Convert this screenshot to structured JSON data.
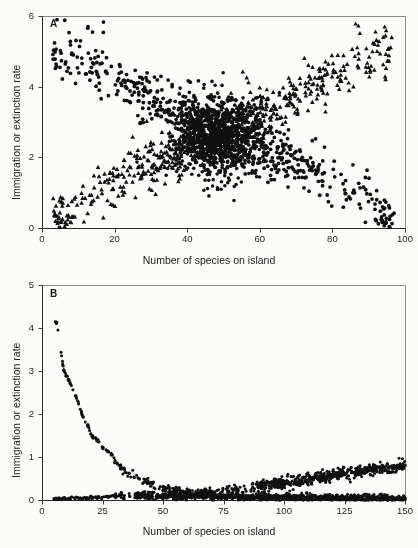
{
  "figure": {
    "background_color": "#fcfcfa",
    "ink_color": "#111111",
    "axis_color": "#8a8a8a"
  },
  "chart_data": [
    {
      "id": "panel-a",
      "type": "scatter",
      "panel_label": "A",
      "title": "",
      "xlabel": "Number of species on island",
      "ylabel": "Immigration or extinction rate",
      "xlim": [
        0,
        100
      ],
      "ylim": [
        0,
        6
      ],
      "xticks": [
        0,
        20,
        40,
        60,
        80,
        100
      ],
      "yticks": [
        0,
        2,
        4,
        6
      ],
      "xticklabels": [
        "0",
        "20",
        "40",
        "60",
        "80",
        "100"
      ],
      "yticklabels": [
        "0",
        "2",
        "4",
        "6"
      ],
      "grid": false,
      "legend": "none",
      "frame": "box",
      "plot_box_px": {
        "left": 42,
        "top": 16,
        "right": 405,
        "bottom": 228
      },
      "series": [
        {
          "name": "immigration rate",
          "marker": "circle",
          "color": "#111111",
          "marker_size": 1.9,
          "n_points": 560,
          "description": "declining cloud from high rate at few species to near zero at ~95 species",
          "trend": {
            "model": "exponential-decay-with-noise",
            "y_at_x5": 4.6,
            "y_at_x25": 3.7,
            "y_at_x45": 2.7,
            "y_at_x65": 1.9,
            "y_at_x85": 0.8,
            "y_at_x95": 0.15,
            "noise_sd": 0.42
          },
          "seed": 20414
        },
        {
          "name": "extinction rate",
          "marker": "triangle",
          "color": "#111111",
          "marker_size": 2.1,
          "n_points": 560,
          "description": "rising cloud from near zero at few species to high rate at ~95 species",
          "trend": {
            "model": "exponential-rise-with-noise",
            "y_at_x5": 0.18,
            "y_at_x25": 1.0,
            "y_at_x45": 2.1,
            "y_at_x65": 3.2,
            "y_at_x85": 4.3,
            "y_at_x95": 5.0,
            "noise_sd": 0.42
          },
          "seed": 77131
        }
      ],
      "dense_cluster": {
        "x_center": 48,
        "y_center": 2.5,
        "x_spread": 6,
        "y_spread": 0.55,
        "n_points": 900
      }
    },
    {
      "id": "panel-b",
      "type": "scatter",
      "panel_label": "B",
      "title": "",
      "xlabel": "Number of species on island",
      "ylabel": "Immigration or extinction rate",
      "xlim": [
        0,
        150
      ],
      "ylim": [
        0,
        5
      ],
      "xticks": [
        0,
        25,
        50,
        75,
        100,
        125,
        150
      ],
      "yticks": [
        0,
        1,
        2,
        3,
        4,
        5
      ],
      "xticklabels": [
        "0",
        "25",
        "50",
        "75",
        "100",
        "125",
        "150"
      ],
      "yticklabels": [
        "0",
        "1",
        "2",
        "3",
        "4",
        "5"
      ],
      "grid": false,
      "legend": "none",
      "frame": "box",
      "plot_box_px": {
        "left": 42,
        "top": 285,
        "right": 405,
        "bottom": 500
      },
      "series": [
        {
          "name": "immigration rate",
          "marker": "circle",
          "color": "#111111",
          "marker_size": 1.5,
          "n_points": 420,
          "description": "steep decay from 4.1 at 6 species down to near 0 by 60 species, then flat along zero",
          "key_points": [
            [
              6,
              4.13
            ],
            [
              9,
              3.02
            ],
            [
              11,
              2.78
            ],
            [
              14,
              2.42
            ],
            [
              17,
              1.93
            ],
            [
              19,
              1.72
            ],
            [
              21,
              1.45
            ],
            [
              23,
              1.4
            ],
            [
              25,
              1.22
            ],
            [
              27,
              1.14
            ],
            [
              29,
              1.05
            ],
            [
              31,
              0.86
            ],
            [
              33,
              0.73
            ],
            [
              36,
              0.62
            ],
            [
              40,
              0.5
            ],
            [
              45,
              0.4
            ],
            [
              50,
              0.3
            ],
            [
              60,
              0.18
            ],
            [
              75,
              0.1
            ],
            [
              100,
              0.06
            ],
            [
              125,
              0.03
            ],
            [
              150,
              0.02
            ]
          ],
          "noise_sd": 0.05,
          "seed": 4471
        },
        {
          "name": "extinction rate",
          "marker": "circle",
          "color": "#111111",
          "marker_size": 1.5,
          "n_points": 420,
          "description": "flat near zero until ~60 species then slowly rising to about 0.8 at 150 species",
          "key_points": [
            [
              5,
              0.03
            ],
            [
              20,
              0.06
            ],
            [
              30,
              0.09
            ],
            [
              40,
              0.12
            ],
            [
              50,
              0.14
            ],
            [
              60,
              0.16
            ],
            [
              70,
              0.2
            ],
            [
              80,
              0.24
            ],
            [
              90,
              0.31
            ],
            [
              100,
              0.4
            ],
            [
              110,
              0.47
            ],
            [
              120,
              0.56
            ],
            [
              130,
              0.66
            ],
            [
              140,
              0.72
            ],
            [
              150,
              0.8
            ]
          ],
          "noise_sd": 0.055,
          "seed": 9902
        }
      ]
    }
  ]
}
